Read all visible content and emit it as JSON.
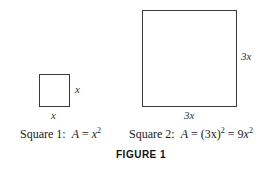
{
  "figure": {
    "label": "FIGURE 1",
    "squares": [
      {
        "name": "Square 1",
        "side_label": "x",
        "bottom_label": "x",
        "caption_prefix": "Square 1:",
        "area_var": "A",
        "equals": "=",
        "area_base": "x",
        "area_exp": "2"
      },
      {
        "name": "Square 2",
        "side_label": "3x",
        "bottom_label": "3x",
        "caption_prefix": "Square 2:",
        "area_var": "A",
        "equals": "=",
        "area_paren": "(3x)",
        "area_paren_exp": "2",
        "equals2": "=",
        "area_coef": "9",
        "area_base": "x",
        "area_exp": "2"
      }
    ]
  }
}
